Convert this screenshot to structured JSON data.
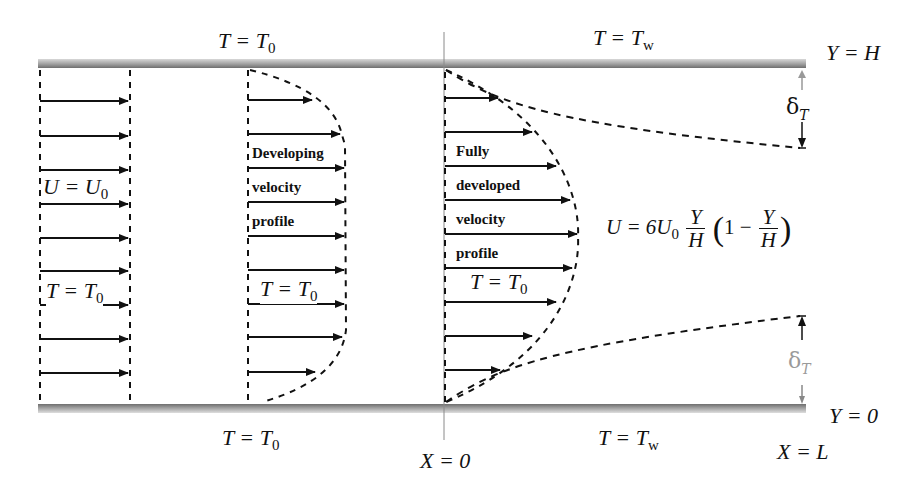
{
  "diagram": {
    "colors": {
      "ink": "#111111",
      "wall": "#8c8c8c",
      "faint_label": "#9a9a9a",
      "background": "#ffffff"
    },
    "walls": {
      "top": {
        "label_left": "T = T",
        "label_left_sub": "0",
        "label_right": "T = T",
        "label_right_sub": "w",
        "position_label": "Y = H"
      },
      "bottom": {
        "label_left": "T = T",
        "label_left_sub": "0",
        "label_right": "T = T",
        "label_right_sub": "w",
        "position_label": "Y = 0"
      }
    },
    "inlet": {
      "velocity_label": "U = U",
      "velocity_sub": "0",
      "temperature_label": "T = T",
      "temperature_sub": "0",
      "arrow_count": 9
    },
    "developing": {
      "text_lines": [
        "Developing",
        "velocity",
        "profile"
      ],
      "temperature_label": "T = T",
      "temperature_sub": "0",
      "arrow_count": 9
    },
    "fully_developed": {
      "text_lines": [
        "Fully",
        "developed",
        "velocity",
        "profile"
      ],
      "temperature_label": "T = T",
      "temperature_sub": "0",
      "arrow_count": 9
    },
    "formula": {
      "lhs": "U = 6U",
      "lhs_sub": "0",
      "frac1_num": "Y",
      "frac1_den": "H",
      "paren_open": "(",
      "one_minus": "1 −",
      "frac2_num": "Y",
      "frac2_den": "H",
      "paren_close": ")"
    },
    "thermal_layer": {
      "symbol": "δ",
      "sub": "T"
    },
    "axis_labels": {
      "x_start": "X = 0",
      "x_end": "X = L"
    }
  }
}
